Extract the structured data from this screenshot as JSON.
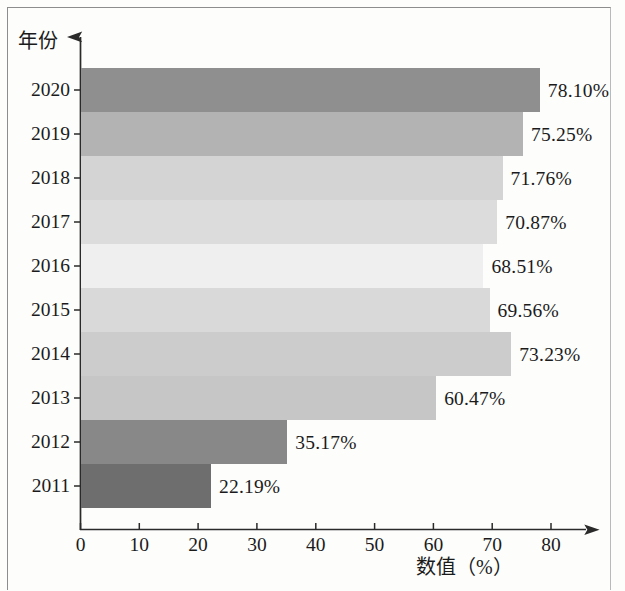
{
  "chart_data": {
    "type": "bar",
    "orientation": "horizontal",
    "title": "",
    "xlabel": "数值（%）",
    "ylabel": "年份",
    "categories": [
      "2020",
      "2019",
      "2018",
      "2017",
      "2016",
      "2015",
      "2014",
      "2013",
      "2012",
      "2011"
    ],
    "values": [
      78.1,
      75.25,
      71.76,
      70.87,
      68.51,
      69.56,
      73.23,
      60.47,
      35.17,
      22.19
    ],
    "value_labels": [
      "78.10%",
      "75.25%",
      "71.76%",
      "70.87%",
      "68.51%",
      "69.56%",
      "73.23%",
      "60.47%",
      "35.17%",
      "22.19%"
    ],
    "bar_colors": [
      "#8f8f8f",
      "#b3b3b3",
      "#d4d4d4",
      "#dcdcdc",
      "#efefef",
      "#d9d9d9",
      "#cccccc",
      "#c6c6c6",
      "#888888",
      "#6e6e6e"
    ],
    "xlim": [
      0,
      80
    ],
    "xticks": [
      "0",
      "10",
      "20",
      "30",
      "40",
      "50",
      "60",
      "70",
      "80"
    ],
    "grid": false,
    "legend": "none",
    "axis_style": "arrow-tipped"
  },
  "axes": {
    "y_title": "年份",
    "x_title": "数值（%）"
  }
}
